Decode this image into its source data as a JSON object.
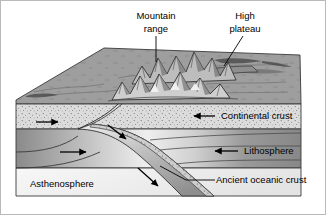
{
  "figure": {
    "title_visible": false,
    "background": "#ffffff",
    "frame_color": "#b9b9b9"
  },
  "labels": {
    "mountain_range": {
      "line1": "Mountain",
      "line2": "range"
    },
    "high_plateau": {
      "line1": "High",
      "line2": "plateau"
    },
    "continental_crust": "Continental crust",
    "lithosphere": "Lithosphere",
    "asthenosphere": "Asthenosphere",
    "ancient_oceanic_crust": "Ancient oceanic crust"
  },
  "layers": [
    {
      "name": "continental-crust",
      "label": "Continental crust",
      "fill": "#d5d5d5",
      "texture": "stipple"
    },
    {
      "name": "lithosphere",
      "label": "Lithosphere",
      "fill": "#8f8f8f",
      "texture": "gradient"
    },
    {
      "name": "asthenosphere",
      "label": "Asthenosphere",
      "fill": "#f2f2f2",
      "texture": "plain"
    },
    {
      "name": "ancient-oceanic-crust",
      "label": "Ancient oceanic crust",
      "fill": "#c8c8c8",
      "texture": "slab"
    }
  ],
  "surface_features": [
    {
      "name": "mountain-range",
      "label": "Mountain range"
    },
    {
      "name": "high-plateau",
      "label": "High plateau"
    }
  ],
  "motion_arrows": [
    {
      "name": "continental-crust-arrow",
      "direction": "left"
    },
    {
      "name": "lithosphere-arrow",
      "direction": "left"
    },
    {
      "name": "upper-crust-convergence-arrow",
      "direction": "right"
    },
    {
      "name": "lithosphere-convergence-arrow",
      "direction": "right"
    },
    {
      "name": "subducting-slab-arrow",
      "direction": "down-right"
    },
    {
      "name": "descending-slab-arrow",
      "direction": "down-right"
    }
  ],
  "colors": {
    "top_surface": "#9e9e9e",
    "crust_fill": "#dcdcdc",
    "lithosphere_fill": "#8d8d8d",
    "asthenosphere_fill": "#f4f4f4",
    "ink": "#000000"
  }
}
